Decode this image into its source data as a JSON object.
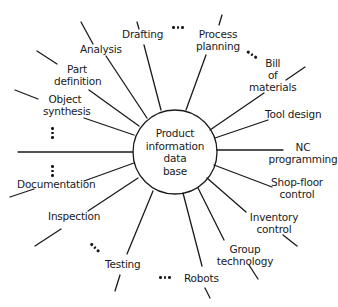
{
  "center": {
    "line1": "Product",
    "line2": "information",
    "line3": "data",
    "line4": "base"
  },
  "nodes": [
    {
      "id": "drafting",
      "lines": [
        "Drafting"
      ]
    },
    {
      "id": "process-planning",
      "lines": [
        "Process",
        "planning"
      ]
    },
    {
      "id": "bill-of-materials",
      "lines": [
        "Bill",
        "of",
        "materials"
      ]
    },
    {
      "id": "tool-design",
      "lines": [
        "Tool design"
      ]
    },
    {
      "id": "nc-programming",
      "lines": [
        "NC",
        "programming"
      ]
    },
    {
      "id": "shop-floor-control",
      "lines": [
        "Shop-floor",
        "control"
      ]
    },
    {
      "id": "inventory-control",
      "lines": [
        "Inventory",
        "control"
      ]
    },
    {
      "id": "group-technology",
      "lines": [
        "Group",
        "technology"
      ]
    },
    {
      "id": "robots",
      "lines": [
        "Robots"
      ]
    },
    {
      "id": "testing",
      "lines": [
        "Testing"
      ]
    },
    {
      "id": "inspection",
      "lines": [
        "Inspection"
      ]
    },
    {
      "id": "documentation",
      "lines": [
        "Documentation"
      ]
    },
    {
      "id": "object-synthesis",
      "lines": [
        "Object",
        "synthesis"
      ]
    },
    {
      "id": "part-definition",
      "lines": [
        "Part",
        "definition"
      ]
    },
    {
      "id": "analysis",
      "lines": [
        "Analysis"
      ]
    }
  ],
  "colors": {
    "ink": "#1a1a1a",
    "background": "#ffffff"
  }
}
